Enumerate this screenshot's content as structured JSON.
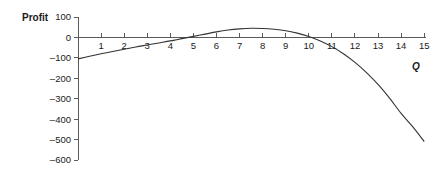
{
  "chart_data": {
    "type": "line",
    "title": "",
    "xlabel": "Q",
    "ylabel": "Profit",
    "xlim": [
      0,
      15
    ],
    "ylim": [
      -600,
      100
    ],
    "grid": false,
    "legend": null,
    "x_ticks": [
      1,
      2,
      3,
      4,
      5,
      6,
      7,
      8,
      9,
      10,
      11,
      12,
      13,
      14,
      15
    ],
    "x_tick_labels": [
      "1",
      "2",
      "3",
      "4",
      "5",
      "6",
      "7",
      "8",
      "9",
      "10",
      "11",
      "12",
      "13",
      "14",
      "15"
    ],
    "y_ticks": [
      100,
      0,
      -100,
      -200,
      -300,
      -400,
      -500,
      -600
    ],
    "y_tick_labels": [
      "100",
      "0",
      "–100",
      "–200",
      "–300",
      "–400",
      "–500",
      "–600"
    ],
    "series": [
      {
        "name": "Profit",
        "color": "#333333",
        "x": [
          0,
          0.5,
          1,
          1.5,
          2,
          2.5,
          3,
          3.5,
          4,
          4.5,
          5,
          5.5,
          6,
          6.5,
          7,
          7.5,
          8,
          8.5,
          9,
          9.5,
          10,
          10.5,
          11,
          11.5,
          12,
          12.5,
          13,
          13.5,
          14,
          14.5,
          15
        ],
        "y": [
          -105,
          -92,
          -80,
          -69,
          -58,
          -47,
          -37,
          -27,
          -17,
          -6,
          5,
          16,
          27,
          36,
          42,
          45,
          44,
          40,
          33,
          21,
          5,
          -17,
          -45,
          -80,
          -122,
          -172,
          -230,
          -297,
          -372,
          -437,
          -510
        ]
      }
    ],
    "zero_crossings": [
      4.6,
      10.3
    ],
    "maximum": {
      "x": 7.5,
      "y": 45
    },
    "start_point": {
      "x": 0,
      "y": -105
    },
    "end_point": {
      "x": 15,
      "y": -510
    }
  },
  "colors": {
    "curve": "#333333",
    "axis": "#5a5a5a",
    "text": "#1a1a1a",
    "background": "#ffffff"
  }
}
